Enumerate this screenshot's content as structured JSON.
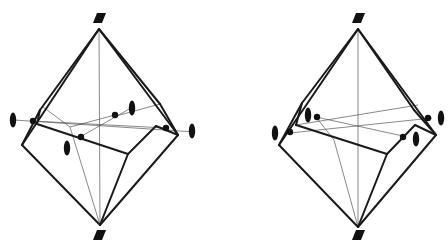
{
  "figure": {
    "colors": {
      "edge": "#1a1a1a",
      "axis": "#555555",
      "symbol": "#111111",
      "background": "#ffffff"
    },
    "panels": [
      {
        "id": "left",
        "top_symbol": "parallelogram (2-fold/4-fold axis marker)",
        "bottom_symbol": "parallelogram",
        "equatorial_symbols": [
          "ellipse",
          "ellipse",
          "ellipse",
          "ellipse"
        ],
        "edges": [
          [
            [
              99,
              29
            ],
            [
              22,
              145
            ]
          ],
          [
            [
              99,
              29
            ],
            [
              40,
              110
            ]
          ],
          [
            [
              99,
              29
            ],
            [
              160,
              104
            ]
          ],
          [
            [
              99,
              29
            ],
            [
              178,
              135
            ]
          ],
          [
            [
              22,
              145
            ],
            [
              40,
              110
            ]
          ],
          [
            [
              40,
              110
            ],
            [
              37,
              124
            ]
          ],
          [
            [
              37,
              124
            ],
            [
              128,
              154
            ]
          ],
          [
            [
              128,
              154
            ],
            [
              156,
              126
            ]
          ],
          [
            [
              156,
              126
            ],
            [
              178,
              135
            ]
          ],
          [
            [
              160,
              104
            ],
            [
              178,
              135
            ]
          ],
          [
            [
              22,
              145
            ],
            [
              100,
              225
            ]
          ],
          [
            [
              128,
              154
            ],
            [
              100,
              225
            ]
          ],
          [
            [
              178,
              135
            ],
            [
              100,
              225
            ]
          ]
        ],
        "axes": [
          [
            [
              99,
              29
            ],
            [
              100,
              225
            ]
          ],
          [
            [
              43,
              107
            ],
            [
              70,
              127
            ]
          ],
          [
            [
              70,
              127
            ],
            [
              100,
              225
            ]
          ],
          [
            [
              14,
              120
            ],
            [
              195,
              132
            ]
          ],
          [
            [
              33,
              121
            ],
            [
              166,
              128
            ]
          ],
          [
            [
              70,
              127
            ],
            [
              115,
              115
            ]
          ],
          [
            [
              80,
              137
            ],
            [
              131,
              108
            ]
          ],
          [
            [
              116,
              116
            ],
            [
              160,
              104
            ]
          ]
        ],
        "dots": [
          [
            33,
            121
          ],
          [
            81,
            137
          ],
          [
            115,
            115
          ],
          [
            166,
            128
          ]
        ],
        "ellipses": [
          [
            13,
            120
          ],
          [
            132,
            108
          ],
          [
            67,
            148
          ],
          [
            192,
            131
          ]
        ],
        "parallelograms": [
          [
            99,
            18
          ],
          [
            99,
            235
          ]
        ]
      },
      {
        "id": "right",
        "top_symbol": "parallelogram",
        "bottom_symbol": "parallelogram",
        "equatorial_symbols": [
          "ellipse",
          "ellipse",
          "ellipse",
          "ellipse"
        ],
        "edges": [
          [
            [
              358,
              29
            ],
            [
              279,
              145
            ]
          ],
          [
            [
              358,
              29
            ],
            [
              302,
              103
            ]
          ],
          [
            [
              358,
              29
            ],
            [
              414,
              110
            ]
          ],
          [
            [
              358,
              29
            ],
            [
              436,
              135
            ]
          ],
          [
            [
              279,
              145
            ],
            [
              302,
              103
            ]
          ],
          [
            [
              302,
              103
            ],
            [
              296,
              125
            ]
          ],
          [
            [
              296,
              125
            ],
            [
              387,
              154
            ]
          ],
          [
            [
              387,
              154
            ],
            [
              415,
              125
            ]
          ],
          [
            [
              415,
              125
            ],
            [
              436,
              135
            ]
          ],
          [
            [
              414,
              110
            ],
            [
              436,
              135
            ]
          ],
          [
            [
              279,
              145
            ],
            [
              358,
              227
            ]
          ],
          [
            [
              387,
              154
            ],
            [
              358,
              227
            ]
          ],
          [
            [
              436,
              135
            ],
            [
              358,
              227
            ]
          ]
        ],
        "axes": [
          [
            [
              358,
              29
            ],
            [
              358,
              227
            ]
          ],
          [
            [
              316,
              117
            ],
            [
              334,
              140
            ]
          ],
          [
            [
              334,
              140
            ],
            [
              358,
              227
            ]
          ],
          [
            [
              290,
              133
            ],
            [
              432,
              118
            ]
          ],
          [
            [
              316,
              117
            ],
            [
              403,
              136
            ]
          ],
          [
            [
              296,
              125
            ],
            [
              418,
              105
            ]
          ]
        ],
        "dots": [
          [
            290,
            132
          ],
          [
            317,
            117
          ],
          [
            403,
            137
          ],
          [
            428,
            118
          ]
        ],
        "ellipses": [
          [
            275,
            133
          ],
          [
            308,
            115
          ],
          [
            416,
            139
          ],
          [
            441,
            118
          ]
        ],
        "parallelograms": [
          [
            358,
            18
          ],
          [
            358,
            235
          ]
        ]
      }
    ]
  }
}
